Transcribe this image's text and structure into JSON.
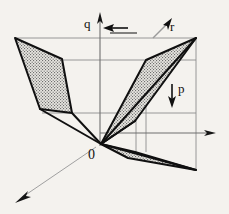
{
  "figure": {
    "kind": "3d-axis-diagram",
    "background_color": "#f4f2ee",
    "line_color": "#111111",
    "guide_color": "#8d8d8d",
    "fill_pattern_color": "#6b6b6b",
    "fill_base_color": "#e8e6e1",
    "labels": {
      "origin": "0",
      "axis_p": "p",
      "axis_q": "q",
      "axis_r": "r"
    },
    "axes": [
      {
        "name": "vertical-axis",
        "from": [
          100,
          145
        ],
        "to": [
          100,
          14
        ],
        "arrow": "up",
        "color": "#6f6f6f"
      },
      {
        "name": "horizontal-axis",
        "from": [
          100,
          133
        ],
        "to": [
          214,
          133
        ],
        "arrow": "right",
        "color": "#6f6f6f"
      },
      {
        "name": "depth-axis",
        "from": [
          93,
          145
        ],
        "to": [
          16,
          200
        ],
        "arrow": "down-left",
        "color": "#9b9b9b"
      }
    ],
    "arrow_markers": [
      {
        "name": "q-arrow",
        "from": [
          126,
          28
        ],
        "to": [
          106,
          28
        ],
        "direction": "left"
      },
      {
        "name": "r-arrow",
        "from": [
          154,
          36
        ],
        "to": [
          172,
          20
        ],
        "direction": "up-right"
      },
      {
        "name": "p-arrow",
        "from": [
          172,
          84
        ],
        "to": [
          172,
          105
        ],
        "direction": "down"
      }
    ],
    "guide_lines": [
      {
        "name": "guide-top",
        "from": [
          15,
          38
        ],
        "to": [
          196,
          38
        ]
      },
      {
        "name": "guide-upper-mid",
        "from": [
          60,
          60
        ],
        "to": [
          196,
          60
        ]
      },
      {
        "name": "guide-lower-mid",
        "from": [
          42,
          113
        ],
        "to": [
          196,
          113
        ]
      },
      {
        "name": "guide-right-vertical",
        "from": [
          196,
          38
        ],
        "to": [
          196,
          170
        ]
      },
      {
        "name": "guide-inner-vertical-a",
        "from": [
          146,
          60
        ],
        "to": [
          146,
          152
        ]
      },
      {
        "name": "guide-inner-vertical-b",
        "from": [
          136,
          113
        ],
        "to": [
          136,
          160
        ]
      }
    ],
    "polygons": [
      {
        "name": "left-shaded-panel",
        "points": "15,38 62,59 72,113 40,109",
        "filled": true
      },
      {
        "name": "right-upper-shaded-panel",
        "points": "146,60 196,38 135,121 101,144",
        "filled": true
      },
      {
        "name": "lower-right-shaded-panel",
        "points": "101,144 136,157 196,170 128,156",
        "filled": true
      }
    ],
    "edges": [
      {
        "name": "edge-origin-to-left-low",
        "from": [
          101,
          144
        ],
        "to": [
          40,
          109
        ]
      },
      {
        "name": "edge-origin-to-right-top",
        "from": [
          101,
          144
        ],
        "to": [
          196,
          38
        ]
      },
      {
        "name": "edge-origin-to-lower-right",
        "from": [
          101,
          144
        ],
        "to": [
          196,
          170
        ]
      },
      {
        "name": "edge-left-top",
        "from": [
          15,
          38
        ],
        "to": [
          62,
          59
        ]
      },
      {
        "name": "edge-left-inner",
        "from": [
          62,
          59
        ],
        "to": [
          72,
          113
        ]
      }
    ]
  }
}
